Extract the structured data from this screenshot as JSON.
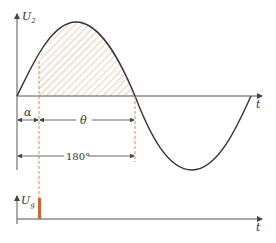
{
  "diagram": {
    "top_plot": {
      "y_axis_label": "U",
      "y_axis_subscript": "2",
      "x_axis_label": "t",
      "annotations": {
        "alpha": "α",
        "theta": "θ",
        "half_period": "180°"
      },
      "shaded_region": "conduction interval from α to π (hatched)"
    },
    "bottom_plot": {
      "y_axis_label": "U",
      "y_axis_subscript": "g",
      "x_axis_label": "t",
      "pulse": "trigger pulse at α"
    },
    "colors": {
      "curve": "#333333",
      "axis": "#555555",
      "hatch": "#e8a070",
      "dashed_guide": "#e07a3a",
      "pulse": "#d9602a"
    }
  }
}
